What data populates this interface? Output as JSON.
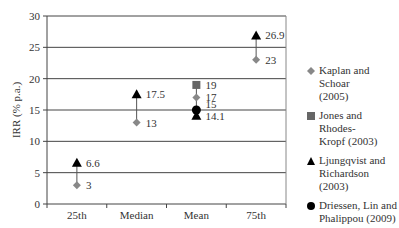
{
  "chart_data": {
    "type": "scatter",
    "title": "",
    "xlabel": "",
    "ylabel": "IRR (% p.a.)",
    "ylim": [
      0,
      30
    ],
    "yticks": [
      0,
      5,
      10,
      15,
      20,
      25,
      30
    ],
    "grid": true,
    "legend_position": "right",
    "categories": [
      "25th",
      "Median",
      "Mean",
      "75th"
    ],
    "series": [
      {
        "name": "Kaplan and Schoar (2005)",
        "marker": "diamond",
        "color": "#888888",
        "values": [
          3,
          13,
          17,
          23
        ]
      },
      {
        "name": "Jones and Rhodes-Kropf (2003)",
        "marker": "square",
        "color": "#666666",
        "values": [
          null,
          null,
          19,
          null
        ]
      },
      {
        "name": "Ljungqvist and Richardson (2003)",
        "marker": "triangle",
        "color": "#000000",
        "values": [
          6.6,
          17.5,
          14.1,
          26.9
        ]
      },
      {
        "name": "Driessen, Lin and Phalippou (2009)",
        "marker": "circle",
        "color": "#000000",
        "values": [
          null,
          null,
          15,
          null
        ]
      }
    ],
    "annotations": [
      "3",
      "6.6",
      "13",
      "17.5",
      "14.1",
      "15",
      "17",
      "19",
      "23",
      "26.9"
    ]
  },
  "legend": {
    "items": [
      {
        "line1": "Kaplan and Schoar",
        "line2": "(2005)"
      },
      {
        "line1": "Jones and Rhodes-",
        "line2": "Kropf (2003)"
      },
      {
        "line1": "Ljungqvist and",
        "line2": "Richardson (2003)"
      },
      {
        "line1": "Driessen, Lin and",
        "line2": "Phalippou (2009)"
      }
    ]
  }
}
